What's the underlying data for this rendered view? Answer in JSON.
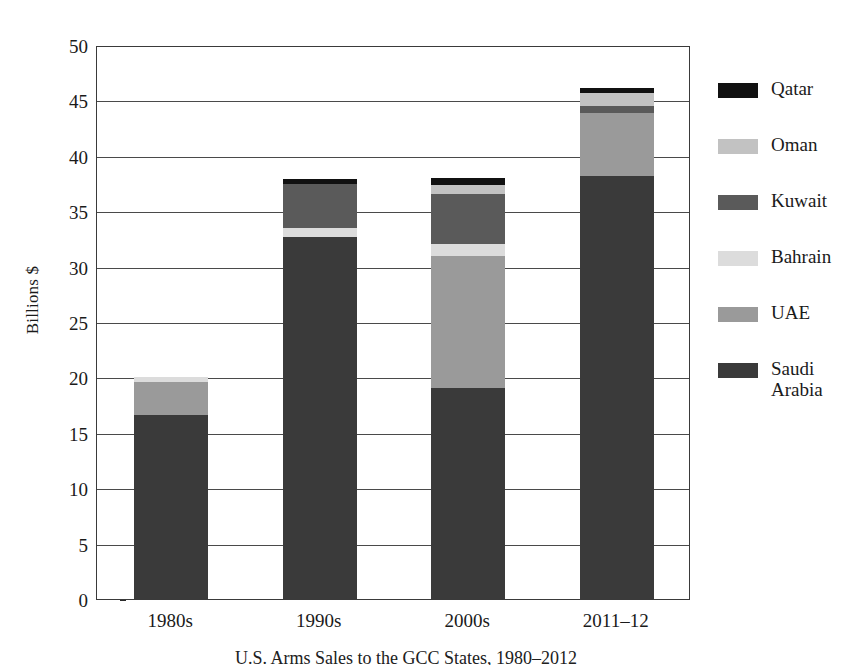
{
  "chart_data": {
    "type": "bar",
    "stacked": true,
    "xlabel": "",
    "ylabel": "Billions $",
    "ylim": [
      0,
      50
    ],
    "ytick_step": 5,
    "yticks": [
      50,
      45,
      40,
      35,
      30,
      25,
      20,
      15,
      10,
      5,
      0
    ],
    "grid": true,
    "legend_position": "right",
    "categories": [
      "1980s",
      "1990s",
      "2000s",
      "2011–12"
    ],
    "series": [
      {
        "name": "Saudi Arabia",
        "color": "#3a3a3a",
        "values": [
          16.6,
          32.7,
          19.0,
          38.2
        ]
      },
      {
        "name": "UAE",
        "color": "#9a9a9a",
        "values": [
          3.0,
          0.0,
          12.0,
          5.7
        ]
      },
      {
        "name": "Bahrain",
        "color": "#dcdcdc",
        "values": [
          0.4,
          0.8,
          1.0,
          0.0
        ]
      },
      {
        "name": "Kuwait",
        "color": "#5a5a5a",
        "values": [
          0.0,
          4.0,
          4.6,
          0.6
        ]
      },
      {
        "name": "Oman",
        "color": "#c2c2c2",
        "values": [
          0.0,
          0.0,
          0.8,
          1.2
        ]
      },
      {
        "name": "Qatar",
        "color": "#111111",
        "values": [
          0.0,
          0.4,
          0.6,
          0.4
        ]
      }
    ],
    "totals": [
      20.0,
      37.9,
      38.0,
      46.1
    ],
    "legend_order": [
      "Qatar",
      "Oman",
      "Kuwait",
      "Bahrain",
      "UAE",
      "Saudi\nArabia"
    ]
  },
  "legend": [
    {
      "label": "Qatar",
      "color": "#111111"
    },
    {
      "label": "Oman",
      "color": "#c2c2c2"
    },
    {
      "label": "Kuwait",
      "color": "#5a5a5a"
    },
    {
      "label": "Bahrain",
      "color": "#dcdcdc"
    },
    {
      "label": "UAE",
      "color": "#9a9a9a"
    },
    {
      "label": "Saudi\nArabia",
      "color": "#3a3a3a"
    }
  ],
  "axis": {
    "y_title": "Billions $",
    "y_labels": [
      "50",
      "45",
      "40",
      "35",
      "30",
      "25",
      "20",
      "15",
      "10",
      "5",
      "0"
    ],
    "x_labels": [
      "1980s",
      "1990s",
      "2000s",
      "2011–12"
    ]
  },
  "caption": {
    "text": "U.S. Arms Sales to the GCC States, 1980–2012"
  }
}
